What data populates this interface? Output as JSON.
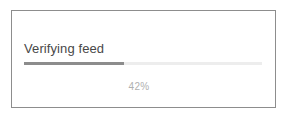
{
  "card": {
    "status": {
      "label": "Verifying feed"
    },
    "progress": {
      "percent_label": "42%",
      "value": 42,
      "min": 0,
      "max": 100,
      "fill_color": "#8c8c8c",
      "track_color": "#ededed"
    },
    "colors": {
      "border": "#8d8d8d",
      "surface": "#ffffff",
      "label_text": "#484848",
      "percent_text": "#b0b0b0"
    }
  },
  "page": {
    "background": "#ffffff"
  }
}
